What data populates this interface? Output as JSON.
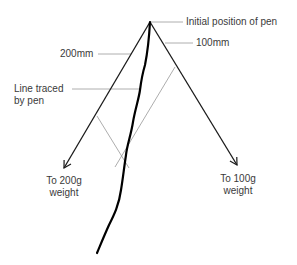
{
  "diagram": {
    "labels": {
      "initial_position": "Initial position of pen",
      "length_right": "100mm",
      "length_left": "200mm",
      "trace_line1": "Line traced",
      "trace_line2": "by pen",
      "left_weight_line1": "To 200g",
      "left_weight_line2": "weight",
      "right_weight_line1": "To 100g",
      "right_weight_line2": "weight"
    },
    "colors": {
      "strings": "#1a1a1a",
      "trace": "#000000",
      "construction": "#8a8a8a",
      "leaders": "#9a9a9a"
    }
  }
}
